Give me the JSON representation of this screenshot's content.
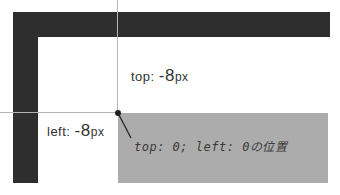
{
  "labels": {
    "top": {
      "prefix": "top: ",
      "value": "-8",
      "unit": "px"
    },
    "left": {
      "prefix": "left: ",
      "value": "-8",
      "unit": "px"
    },
    "origin_note": "top: 0; left: 0の位置"
  },
  "colors": {
    "frame": "#2e2e2e",
    "box": "#acacac",
    "guide": "#b5b5b5",
    "text": "#333333"
  }
}
